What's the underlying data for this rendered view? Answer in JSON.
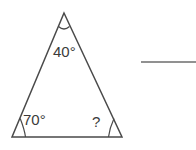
{
  "figure": {
    "type": "triangle-angle-diagram",
    "background_color": "#ffffff",
    "stroke_color": "#4a4a4a",
    "text_color": "#3b3b3b",
    "rule_color": "#6d6d6d",
    "triangle": {
      "name": "triangle",
      "vertices": {
        "apex": {
          "x": 64,
          "y": 13
        },
        "bottom_left": {
          "x": 12,
          "y": 137
        },
        "bottom_right": {
          "x": 122,
          "y": 137
        }
      }
    },
    "angles": {
      "apex": {
        "label": "40°",
        "value": 40,
        "unit": "degrees",
        "marker": "arc"
      },
      "bottom_left": {
        "label": "70°",
        "value": 70,
        "unit": "degrees",
        "marker": "arc"
      },
      "bottom_right": {
        "label": "?",
        "value": null,
        "unit": "degrees",
        "marker": "arc"
      }
    },
    "answer_rule": {
      "name": "answer-line",
      "x_start": 141,
      "x_end": 196,
      "y": 62
    }
  }
}
